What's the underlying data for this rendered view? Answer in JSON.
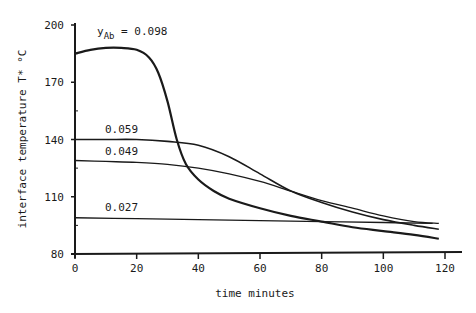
{
  "chart_data": {
    "type": "line",
    "title": "",
    "xlabel": "time  minutes",
    "ylabel": "interface temperature T* °C",
    "xlim": [
      0,
      120
    ],
    "ylim": [
      80,
      200
    ],
    "xticks": [
      "0",
      "20",
      "40",
      "60",
      "80",
      "100",
      "120"
    ],
    "yticks": [
      "80",
      "110",
      "140",
      "170",
      "200"
    ],
    "grid": false,
    "legend": "inline labels",
    "series_label_prefix": "y",
    "series_label_subscript": "Ab",
    "series": [
      {
        "name": "0.098",
        "label": "yAb = 0.098",
        "x": [
          0,
          5,
          10,
          15,
          20,
          24,
          27,
          30,
          33,
          36,
          40,
          45,
          50,
          60,
          70,
          80,
          90,
          100,
          110,
          118
        ],
        "values": [
          185,
          187,
          188,
          188,
          187,
          183,
          175,
          160,
          140,
          127,
          119,
          113,
          109,
          104,
          100,
          97,
          94,
          92,
          90,
          88
        ]
      },
      {
        "name": "0.059",
        "label": "0.059",
        "x": [
          0,
          10,
          20,
          30,
          40,
          50,
          60,
          70,
          80,
          90,
          100,
          110,
          118
        ],
        "values": [
          140,
          140,
          140,
          139,
          137,
          131,
          122,
          113,
          107,
          102,
          98,
          95,
          93
        ]
      },
      {
        "name": "0.049",
        "label": "0.049",
        "x": [
          0,
          10,
          20,
          30,
          40,
          50,
          60,
          70,
          80,
          90,
          100,
          110,
          118
        ],
        "values": [
          129,
          128.5,
          128,
          127,
          125,
          122,
          118,
          113,
          108,
          104,
          100,
          97,
          96
        ]
      },
      {
        "name": "0.027",
        "label": "0.027",
        "x": [
          0,
          20,
          40,
          60,
          80,
          100,
          116
        ],
        "values": [
          99,
          98.5,
          98,
          97.5,
          97,
          96.5,
          96
        ]
      }
    ]
  }
}
